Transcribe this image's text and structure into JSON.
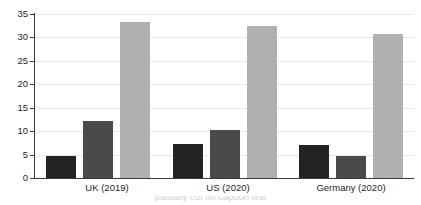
{
  "chart_data": {
    "type": "bar",
    "title": "",
    "subtitle": "",
    "xlabel": "",
    "ylabel": "",
    "ylim": [
      0,
      35
    ],
    "yticks": [
      0,
      5,
      10,
      15,
      20,
      25,
      30,
      35
    ],
    "grid": true,
    "legend": "none",
    "categories": [
      "UK (2019)",
      "US (2020)",
      "Germany (2020)"
    ],
    "series": [
      {
        "name": "series-1",
        "color": "#232323",
        "values": [
          4.6,
          7.2,
          7.0
        ]
      },
      {
        "name": "series-2",
        "color": "#4a4a4c",
        "values": [
          12.2,
          10.2,
          4.7
        ]
      },
      {
        "name": "series-3",
        "color": "#b0b0b1",
        "values": [
          33.3,
          32.4,
          30.8
        ]
      }
    ]
  },
  "axis": {
    "y_tick_labels": [
      "35",
      "30",
      "25",
      "20",
      "15",
      "10",
      "5",
      "0"
    ],
    "x_tick_labels": [
      "UK (2019)",
      "US (2020)",
      "Germany (2020)"
    ]
  },
  "caption": {
    "clipped_text": "partially cut off caption line"
  },
  "colors": {
    "background": "#ffffff",
    "axis": "#3b3b3d",
    "gridline": "#e9e9ea",
    "text": "#231f20",
    "bar_dark": "#232323",
    "bar_mid": "#4a4a4c",
    "bar_light": "#b0b0b1"
  }
}
